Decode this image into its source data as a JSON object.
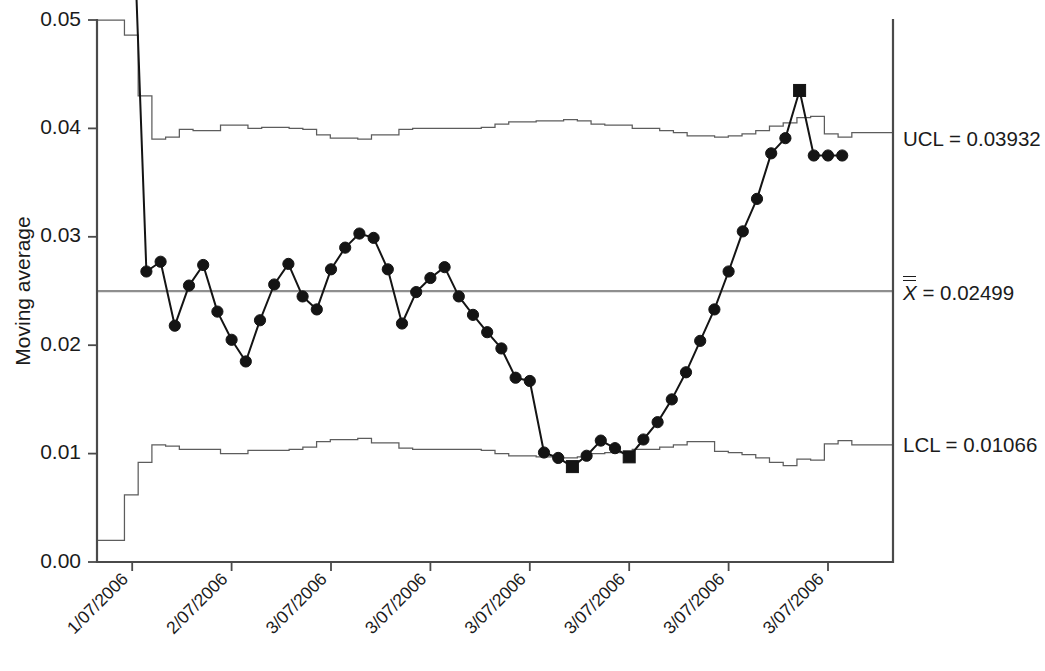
{
  "chart_data": {
    "type": "line",
    "title": "",
    "subtitle": "",
    "xlabel": "",
    "ylabel": "Moving average",
    "ylim": [
      0.0,
      0.05
    ],
    "yticks": [
      0.0,
      0.01,
      0.02,
      0.03,
      0.04,
      0.05
    ],
    "ytick_labels": [
      "0.00",
      "0.01",
      "0.02",
      "0.03",
      "0.04",
      "0.05"
    ],
    "grid": false,
    "legend_position": "right-outside",
    "xtick_labels": [
      "1/07/2006",
      "2/07/2006",
      "3/07/2006",
      "3/07/2006",
      "3/07/2006",
      "3/07/2006",
      "3/07/2006",
      "3/07/2006",
      "3/07/2006",
      "3/07/2006",
      "3/07/2006",
      "3/07/2006"
    ],
    "xtick_index": [
      1,
      8,
      15,
      22,
      29,
      36,
      43,
      50,
      57,
      64,
      71,
      78
    ],
    "n_points": 84,
    "series": [
      {
        "name": "Moving average",
        "marker": "circle",
        "values": [
          0.0735,
          0.063,
          0.0268,
          0.0277,
          0.0218,
          0.0255,
          0.0274,
          0.0231,
          0.0205,
          0.0185,
          0.0223,
          0.0256,
          0.0275,
          0.0245,
          0.0233,
          0.027,
          0.029,
          0.0303,
          0.0299,
          0.027,
          0.022,
          0.0249,
          0.0262,
          0.0272,
          0.0245,
          0.0228,
          0.0212,
          0.0197,
          0.017,
          0.0167,
          0.0101,
          0.0096,
          0.0088,
          0.0098,
          0.0112,
          0.0105,
          0.0097,
          0.0113,
          0.0129,
          0.015,
          0.0175,
          0.0204,
          0.0233,
          0.0268,
          0.0305,
          0.0335,
          0.0377,
          0.0391,
          0.0435,
          0.0375,
          0.0375,
          0.0375
        ]
      }
    ],
    "violations": [
      {
        "index": 32,
        "value": 0.0088,
        "rule": "below-LCL"
      },
      {
        "index": 36,
        "value": 0.0097,
        "rule": "below-LCL"
      },
      {
        "index": 48,
        "value": 0.0435,
        "rule": "above-UCL"
      }
    ],
    "control_limits": {
      "center_label_math": "X",
      "center_label_suffix": " = 0.02499",
      "center_value": 0.02499,
      "ucl_label": "UCL = 0.03932",
      "ucl_value": 0.03932,
      "lcl_label": "LCL = 0.01066",
      "lcl_value": 0.01066,
      "ucl_is_stepped": true,
      "lcl_is_stepped": true,
      "ucl_steps": [
        0.05,
        0.05,
        0.0486,
        0.043,
        0.039,
        0.0392,
        0.0399,
        0.0398,
        0.0398,
        0.0403,
        0.0403,
        0.04,
        0.0401,
        0.0401,
        0.04,
        0.0399,
        0.0394,
        0.0391,
        0.0391,
        0.039,
        0.0394,
        0.0394,
        0.0399,
        0.04,
        0.04,
        0.04,
        0.04,
        0.04,
        0.0401,
        0.0404,
        0.0406,
        0.0406,
        0.0407,
        0.0407,
        0.0408,
        0.0407,
        0.0404,
        0.0403,
        0.0403,
        0.04,
        0.04,
        0.0398,
        0.0396,
        0.0393,
        0.0393,
        0.0392,
        0.0393,
        0.0395,
        0.0398,
        0.0402,
        0.0405,
        0.041,
        0.0411,
        0.0395,
        0.0392,
        0.0396,
        0.0396,
        0.0396
      ],
      "lcl_steps": [
        0.002,
        0.002,
        0.0062,
        0.0092,
        0.0108,
        0.0107,
        0.0104,
        0.0104,
        0.0104,
        0.01,
        0.01,
        0.0103,
        0.0103,
        0.0103,
        0.0104,
        0.0106,
        0.0111,
        0.0113,
        0.0113,
        0.0114,
        0.011,
        0.011,
        0.0105,
        0.0104,
        0.0104,
        0.0104,
        0.0104,
        0.0104,
        0.0103,
        0.01,
        0.0098,
        0.0098,
        0.0097,
        0.0097,
        0.0096,
        0.0097,
        0.01,
        0.0101,
        0.0101,
        0.0104,
        0.0104,
        0.0106,
        0.0108,
        0.0111,
        0.0111,
        0.0102,
        0.0101,
        0.0099,
        0.0096,
        0.0092,
        0.0089,
        0.0095,
        0.0094,
        0.0109,
        0.0112,
        0.0108,
        0.0108,
        0.0108
      ]
    }
  },
  "annotations": {
    "ucl": "UCL = 0.03932",
    "center_math": "X",
    "center_rest": " = 0.02499",
    "lcl": "LCL = 0.01066"
  }
}
